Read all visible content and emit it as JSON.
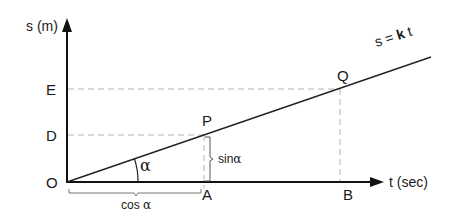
{
  "diagram": {
    "y_axis_label": "s (m)",
    "x_axis_label": "t (sec)",
    "line_label_prefix": "s = ",
    "line_label_k": "k",
    "line_label_suffix": " t",
    "points": {
      "origin": "O",
      "E": "E",
      "D": "D",
      "P": "P",
      "Q": "Q",
      "A": "A",
      "B": "B"
    },
    "angle_label": "α",
    "sin_label_text": "sin",
    "sin_label_greek": "α",
    "cos_label_text": "cos ",
    "cos_label_greek": "α"
  }
}
